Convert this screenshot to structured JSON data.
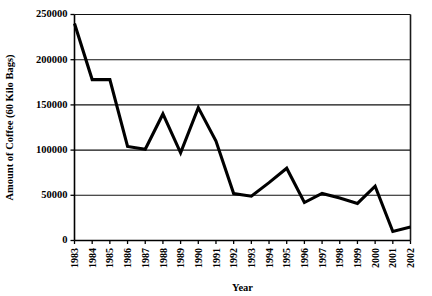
{
  "chart_data": {
    "type": "line",
    "title": "",
    "xlabel": "Year",
    "ylabel": "Amount of Coffee (60 Kilo Bags)",
    "categories": [
      "1983",
      "1984",
      "1985",
      "1986",
      "1987",
      "1988",
      "1989",
      "1990",
      "1991",
      "1992",
      "1993",
      "1994",
      "1995",
      "1996",
      "1997",
      "1998",
      "1999",
      "2000",
      "2001",
      "2002"
    ],
    "values": [
      240000,
      178000,
      178000,
      104000,
      101000,
      140000,
      97000,
      147000,
      110000,
      52000,
      49000,
      64000,
      80000,
      42000,
      52000,
      47000,
      41000,
      60000,
      10000,
      15000
    ],
    "series": [
      {
        "name": "Amount of Coffee",
        "values": [
          240000,
          178000,
          178000,
          104000,
          101000,
          140000,
          97000,
          147000,
          110000,
          52000,
          49000,
          64000,
          80000,
          42000,
          52000,
          47000,
          41000,
          60000,
          10000,
          15000
        ]
      }
    ],
    "ylim": [
      0,
      250000
    ],
    "yticks": [
      0,
      50000,
      100000,
      150000,
      200000,
      250000
    ],
    "ytick_labels": [
      "0",
      "50000",
      "100000",
      "150000",
      "200000",
      "250000"
    ],
    "xtick_labels": [
      "1983",
      "1984",
      "1985",
      "1986",
      "1987",
      "1988",
      "1989",
      "1990",
      "1991",
      "1992",
      "1993",
      "1994",
      "1995",
      "1996",
      "1997",
      "1998",
      "1999",
      "2000",
      "2001",
      "2002"
    ],
    "grid": true,
    "grid_axis": "y",
    "legend": false,
    "legend_position": "none",
    "line_color": "#000000",
    "background_color": "#ffffff"
  }
}
